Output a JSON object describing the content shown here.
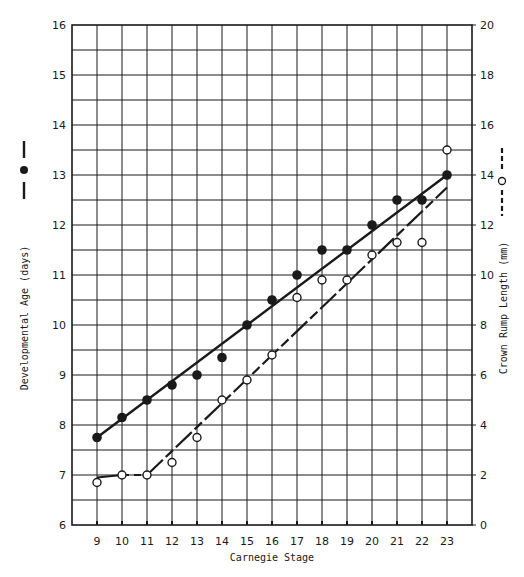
{
  "chart_data": {
    "type": "scatter",
    "title": "",
    "xlabel": "Carnegie Stage",
    "ylabel": "Developmental Age (days)",
    "y2label": "Crown Rump Length (mm)",
    "x": [
      9,
      10,
      11,
      12,
      13,
      14,
      15,
      16,
      17,
      18,
      19,
      20,
      21,
      22,
      23
    ],
    "xlim": [
      8,
      24
    ],
    "ylim": [
      6,
      16
    ],
    "y2lim": [
      0,
      20
    ],
    "x_ticks": [
      9,
      10,
      11,
      12,
      13,
      14,
      15,
      16,
      17,
      18,
      19,
      20,
      21,
      22,
      23
    ],
    "y_ticks": [
      6,
      7,
      8,
      9,
      10,
      11,
      12,
      13,
      14,
      15,
      16
    ],
    "y2_ticks": [
      0,
      2,
      4,
      6,
      8,
      10,
      12,
      14,
      16,
      18,
      20
    ],
    "grid": true,
    "series": [
      {
        "name": "Developmental Age (days)",
        "axis": "left",
        "marker": "filled-circle",
        "line_style": "solid",
        "values": [
          7.75,
          8.15,
          8.5,
          8.8,
          9.0,
          9.35,
          10.0,
          10.5,
          11.0,
          11.5,
          11.5,
          12.0,
          12.5,
          12.5,
          13.0
        ],
        "fit_line": [
          [
            9,
            7.75
          ],
          [
            23,
            13.0
          ]
        ]
      },
      {
        "name": "Crown Rump Length (mm)",
        "axis": "right",
        "marker": "open-circle",
        "line_style": "dashed",
        "values": [
          1.7,
          2.0,
          2.0,
          2.5,
          3.5,
          5.0,
          5.8,
          6.8,
          9.1,
          9.8,
          9.8,
          10.8,
          11.3,
          11.3,
          15.0
        ],
        "fit_line": [
          [
            9,
            1.9
          ],
          [
            10,
            2.0
          ],
          [
            11,
            2.0
          ],
          [
            23,
            13.5
          ]
        ]
      }
    ],
    "legend": [
      {
        "label": "Developmental Age (days)",
        "symbol": "—●—",
        "position": "left-axis"
      },
      {
        "label": "Crown Rump Length (mm)",
        "symbol": "--○--",
        "position": "right-axis"
      }
    ]
  }
}
